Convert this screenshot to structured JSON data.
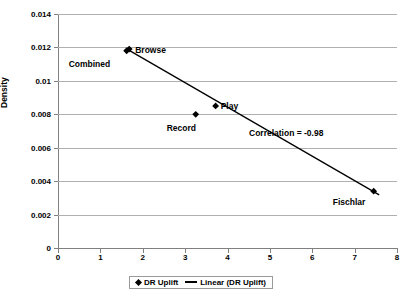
{
  "chart_data": {
    "type": "scatter",
    "title": "",
    "xlabel": "",
    "ylabel": "Density",
    "xlim": [
      0,
      8
    ],
    "ylim": [
      0,
      0.014
    ],
    "grid": true,
    "legend_position": "bottom",
    "xticks": [
      "0",
      "1",
      "2",
      "3",
      "4",
      "5",
      "6",
      "7",
      "8"
    ],
    "xtick_values": [
      0,
      1,
      2,
      3,
      4,
      5,
      6,
      7,
      8
    ],
    "yticks": [
      "0",
      "0.002",
      "0.004",
      "0.006",
      "0.008",
      "0.01",
      "0.012",
      "0.014"
    ],
    "ytick_values": [
      0,
      0.002,
      0.004,
      0.006,
      0.008,
      0.01,
      0.012,
      0.014
    ],
    "series": [
      {
        "name": "DR Uplift",
        "marker": "diamond",
        "color": "#000000",
        "points": [
          {
            "label": "Combined",
            "x": 1.62,
            "y": 0.0118,
            "label_dx": -58,
            "label_dy": 8
          },
          {
            "label": "Browse",
            "x": 1.68,
            "y": 0.0119,
            "label_dx": 6,
            "label_dy": -4
          },
          {
            "label": "Record",
            "x": 3.25,
            "y": 0.008,
            "label_dx": -29,
            "label_dy": 9
          },
          {
            "label": "Play",
            "x": 3.72,
            "y": 0.0085,
            "label_dx": 5,
            "label_dy": -5
          },
          {
            "label": "Fischlar",
            "x": 7.45,
            "y": 0.0034,
            "label_dx": -41,
            "label_dy": 6
          }
        ]
      },
      {
        "name": "Linear (DR Uplift)",
        "type": "trendline",
        "color": "#000000",
        "x_start": 1.66,
        "y_start": 0.01185,
        "x_end": 7.58,
        "y_end": 0.00318
      }
    ],
    "annotations": [
      {
        "name": "correlation",
        "text": "Correlation = -0.98",
        "x": 4.5,
        "y": 0.0065
      }
    ]
  },
  "legend": {
    "entries": [
      {
        "label": "DR Uplift",
        "marker": "diamond"
      },
      {
        "label": "Linear (DR Uplift)",
        "marker": "line"
      }
    ]
  }
}
